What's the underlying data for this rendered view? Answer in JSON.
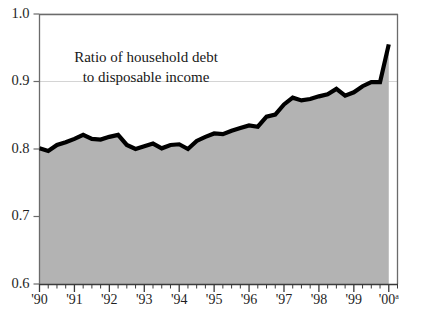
{
  "chart_data": {
    "type": "area",
    "title": "Ratio of household debt to disposable income",
    "title_lines": [
      "Ratio of household debt",
      "to disposable income"
    ],
    "xlabel": "",
    "ylabel": "",
    "ylim": [
      0.6,
      1.0
    ],
    "xlim": [
      1990.0,
      2000.25
    ],
    "grid": true,
    "grid_note": "faint horizontal gridlines at 1.0 and 0.9",
    "legend": null,
    "legend_position": "none",
    "colors": {
      "fill": "#b3b3b3",
      "line": "#000000",
      "axis": "#6b6b6b",
      "text": "#1f1f1f",
      "background": "#ffffff"
    },
    "ytick_labels": [
      "1.0",
      "0.9",
      "0.8",
      "0.7",
      "0.6"
    ],
    "ytick_values": [
      1.0,
      0.9,
      0.8,
      0.7,
      0.6
    ],
    "xtick_labels": [
      "'90",
      "'91",
      "'92",
      "'93",
      "'94",
      "'95",
      "'96",
      "'97",
      "'98",
      "'99",
      "'00"
    ],
    "xtick_values": [
      1990,
      1991,
      1992,
      1993,
      1994,
      1995,
      1996,
      1997,
      1998,
      1999,
      2000
    ],
    "xtick_last_superscript": "a",
    "minor_ticks_per_year": 4,
    "minor_tick_note": "quarterly tick marks between labeled years",
    "x": [
      1990.0,
      1990.25,
      1990.5,
      1990.75,
      1991.0,
      1991.25,
      1991.5,
      1991.75,
      1992.0,
      1992.25,
      1992.5,
      1992.75,
      1993.0,
      1993.25,
      1993.5,
      1993.75,
      1994.0,
      1994.25,
      1994.5,
      1994.75,
      1995.0,
      1995.25,
      1995.5,
      1995.75,
      1996.0,
      1996.25,
      1996.5,
      1996.75,
      1997.0,
      1997.25,
      1997.5,
      1997.75,
      1998.0,
      1998.25,
      1998.5,
      1998.75,
      1999.0,
      1999.25,
      1999.5,
      1999.75,
      2000.0
    ],
    "values": [
      0.801,
      0.797,
      0.806,
      0.81,
      0.815,
      0.821,
      0.815,
      0.814,
      0.818,
      0.821,
      0.806,
      0.8,
      0.804,
      0.808,
      0.801,
      0.806,
      0.807,
      0.8,
      0.812,
      0.818,
      0.823,
      0.822,
      0.827,
      0.831,
      0.835,
      0.833,
      0.848,
      0.851,
      0.866,
      0.876,
      0.872,
      0.874,
      0.878,
      0.881,
      0.889,
      0.879,
      0.884,
      0.893,
      0.899,
      0.899,
      0.955
    ],
    "series": [
      {
        "name": "Ratio of household debt to disposable income",
        "values": [
          0.801,
          0.797,
          0.806,
          0.81,
          0.815,
          0.821,
          0.815,
          0.814,
          0.818,
          0.821,
          0.806,
          0.8,
          0.804,
          0.808,
          0.801,
          0.806,
          0.807,
          0.8,
          0.812,
          0.818,
          0.823,
          0.822,
          0.827,
          0.831,
          0.835,
          0.833,
          0.848,
          0.851,
          0.866,
          0.876,
          0.872,
          0.874,
          0.878,
          0.881,
          0.889,
          0.879,
          0.884,
          0.893,
          0.899,
          0.899,
          0.955
        ]
      }
    ],
    "annotations": []
  }
}
